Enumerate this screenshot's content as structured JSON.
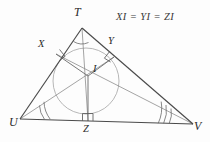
{
  "figure": {
    "type": "euclidean-geometry-diagram",
    "caption": "XI = YI = ZI",
    "stroke_color": "#555555",
    "light_stroke_color": "#9a9a9a",
    "label_color": "#2b2b2b",
    "background": "#fdfdfd",
    "triangle": {
      "name": "TUV",
      "vertices": [
        {
          "id": "T",
          "label": "T",
          "x": 82,
          "y": 28,
          "label_x": 74,
          "label_y": 8,
          "arc_marks": 1
        },
        {
          "id": "U",
          "label": "U",
          "x": 20,
          "y": 119,
          "label_x": 10,
          "label_y": 116,
          "arc_marks": 2
        },
        {
          "id": "V",
          "label": "V",
          "x": 193,
          "y": 124,
          "label_x": 194,
          "label_y": 120,
          "arc_marks": 3
        }
      ]
    },
    "incenter": {
      "id": "I",
      "label": "I",
      "x": 88,
      "y": 76,
      "label_x": 93,
      "label_y": 64
    },
    "incircle": {
      "cx": 86,
      "cy": 81,
      "r": 33
    },
    "touch_points": [
      {
        "id": "X",
        "label": "X",
        "on_side": "TU",
        "x": 56,
        "y": 54,
        "label_x": 40,
        "label_y": 41,
        "right_angle": true
      },
      {
        "id": "Y",
        "label": "Y",
        "on_side": "TV",
        "x": 114,
        "y": 57,
        "label_x": 110,
        "label_y": 38,
        "right_angle": true
      },
      {
        "id": "Z",
        "label": "Z",
        "on_side": "UV",
        "x": 88,
        "y": 121,
        "label_x": 83,
        "label_y": 124,
        "right_angle": true
      }
    ],
    "bisectors": [
      {
        "from": "T",
        "to": "I",
        "extends_to": "Z"
      },
      {
        "from": "U",
        "to": "I",
        "extends_to": "Y"
      },
      {
        "from": "V",
        "to": "I",
        "extends_to": "X"
      }
    ],
    "radii": [
      {
        "from": "I",
        "to": "X"
      },
      {
        "from": "I",
        "to": "Y"
      },
      {
        "from": "I",
        "to": "Z"
      }
    ]
  }
}
